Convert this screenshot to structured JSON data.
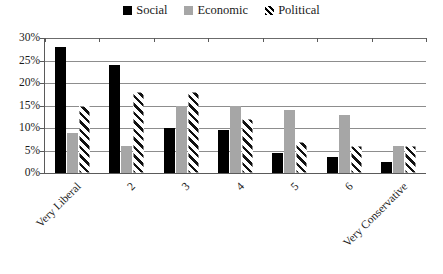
{
  "chart_data": {
    "type": "bar",
    "title": "",
    "subtitle": "",
    "xlabel": "",
    "ylabel": "",
    "ylim": [
      0,
      30
    ],
    "yticks": [
      "0%",
      "5%",
      "10%",
      "15%",
      "20%",
      "25%",
      "30%"
    ],
    "ytick_values": [
      0,
      5,
      10,
      15,
      20,
      25,
      30
    ],
    "grid": "horizontal",
    "legend_position": "top-center",
    "categories": [
      "Very Liberal",
      "2",
      "3",
      "4",
      "5",
      "6",
      "Very Conservative"
    ],
    "series": [
      {
        "name": "Social",
        "swatch": "solid-black",
        "color": "#000000",
        "values": [
          28,
          24,
          10,
          9.5,
          4.5,
          3.5,
          2.5
        ]
      },
      {
        "name": "Economic",
        "swatch": "solid-gray",
        "color": "#a6a6a6",
        "values": [
          9,
          6,
          15,
          15,
          14,
          13,
          6
        ]
      },
      {
        "name": "Political",
        "swatch": "diagonal-hatch",
        "color": "#ffffff",
        "values": [
          15,
          18,
          18,
          12,
          7,
          6,
          6
        ]
      }
    ]
  },
  "legend": {
    "entries": [
      {
        "label": "Social"
      },
      {
        "label": "Economic"
      },
      {
        "label": "Political"
      }
    ]
  },
  "axes": {
    "y": {
      "ticks": [
        "0%",
        "5%",
        "10%",
        "15%",
        "20%",
        "25%",
        "30%"
      ]
    },
    "x": {
      "labels": [
        "Very Liberal",
        "2",
        "3",
        "4",
        "5",
        "6",
        "Very Conservative"
      ]
    }
  }
}
